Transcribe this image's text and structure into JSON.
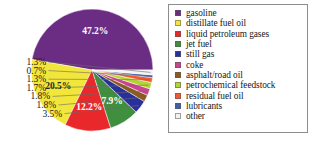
{
  "chart_data": {
    "type": "pie",
    "title": "",
    "subtitle": "",
    "xlabel": "",
    "ylabel": "",
    "grid": false,
    "legend_position": "right",
    "value_unit": "%",
    "categories": [
      "gasoline",
      "distillate fuel oil",
      "liquid petroleum gases",
      "jet fuel",
      "still gas",
      "coke",
      "asphalt/road oil",
      "petrochemical feedstock",
      "residual fuel oil",
      "lubricants",
      "other"
    ],
    "values": [
      47.2,
      20.5,
      12.2,
      7.9,
      3.5,
      1.8,
      1.8,
      1.7,
      1.3,
      0.7,
      1.3
    ],
    "colors": [
      "#6b2d84",
      "#f2e63a",
      "#e8282a",
      "#3f8f3f",
      "#2a2f9e",
      "#8a5a22",
      "#c8468f",
      "#b4d432",
      "#f15a33",
      "#3f5fa8",
      "#f2f2f2"
    ],
    "slice_labels": [
      {
        "text": "47.2%",
        "placement": "inside",
        "color": "#ffffff"
      },
      {
        "text": "20.5%",
        "placement": "inside",
        "color": "#3a3a3a"
      },
      {
        "text": "12.2%",
        "placement": "inside",
        "color": "#ffffff"
      },
      {
        "text": "7.9%",
        "placement": "inside",
        "color": "#ffffff"
      },
      {
        "text": "3.5%",
        "placement": "outside",
        "color": "#1b1b1b"
      },
      {
        "text": "1.8%",
        "placement": "outside",
        "color": "#1b1b1b"
      },
      {
        "text": "1.8%",
        "placement": "outside",
        "color": "#1b1b1b"
      },
      {
        "text": "1.7%",
        "placement": "outside",
        "color": "#1b1b1b"
      },
      {
        "text": "1.3%",
        "placement": "outside",
        "color": "#1b1b1b"
      },
      {
        "text": "0.7%",
        "placement": "outside",
        "color": "#1b1b1b"
      },
      {
        "text": "1.3%",
        "placement": "outside",
        "color": "#1b1b1b"
      }
    ]
  },
  "pie": {
    "inside_labels": {
      "gasoline": "47.2%",
      "distillate_fuel_oil": "20.5%",
      "liquid_petroleum_gases": "12.2%",
      "jet_fuel": "7.9%"
    },
    "callouts": [
      {
        "text": "1.3%"
      },
      {
        "text": "0.7%"
      },
      {
        "text": "1.3%"
      },
      {
        "text": "1.7%"
      },
      {
        "text": "1.8%"
      },
      {
        "text": "1.8%"
      },
      {
        "text": "3.5%"
      }
    ]
  },
  "legend": {
    "items": [
      {
        "label": "gasoline",
        "color": "#6b2d84"
      },
      {
        "label": "distillate fuel oil",
        "color": "#f2e63a"
      },
      {
        "label": "liquid petroleum gases",
        "color": "#e8282a"
      },
      {
        "label": "jet fuel",
        "color": "#3f8f3f"
      },
      {
        "label": "still gas",
        "color": "#2a2f9e"
      },
      {
        "label": "coke",
        "color": "#c8468f"
      },
      {
        "label": "asphalt/road oil",
        "color": "#8a5a22"
      },
      {
        "label": "petrochemical feedstock",
        "color": "#b4d432"
      },
      {
        "label": "residual fuel oil",
        "color": "#f15a33"
      },
      {
        "label": "lubricants",
        "color": "#3f5fa8"
      },
      {
        "label": "other",
        "color": "#f2f2f2"
      }
    ]
  }
}
